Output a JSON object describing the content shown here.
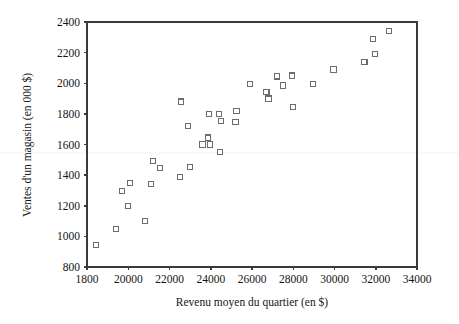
{
  "chart_data": {
    "type": "scatter",
    "title": "",
    "xlabel": "Revenu moyen du quartier (en $)",
    "ylabel": "Ventes d'un magasin (en 000 $)",
    "xlim": [
      18000,
      34000
    ],
    "ylim": [
      800,
      2400
    ],
    "xticks": [
      18000,
      20000,
      22000,
      24000,
      26000,
      28000,
      30000,
      32000,
      34000
    ],
    "xtick_labels": [
      "1800",
      "20000",
      "22000",
      "24000",
      "26000",
      "28000",
      "30000",
      "32000",
      "34000"
    ],
    "yticks": [
      800,
      1000,
      1200,
      1400,
      1600,
      1800,
      2000,
      2200,
      2400
    ],
    "ytick_labels": [
      "800",
      "1000",
      "1200",
      "1400",
      "1600",
      "1800",
      "2000",
      "2200",
      "2400"
    ],
    "grid": false,
    "legend": false,
    "marker": "open-square",
    "marker_color": "#6b6b70",
    "points": [
      [
        18450,
        945
      ],
      [
        19400,
        1050
      ],
      [
        19700,
        1295
      ],
      [
        20000,
        1200
      ],
      [
        20100,
        1350
      ],
      [
        20800,
        1100
      ],
      [
        21100,
        1340
      ],
      [
        21200,
        1490
      ],
      [
        21550,
        1445
      ],
      [
        22500,
        1390
      ],
      [
        22550,
        1880
      ],
      [
        22900,
        1720
      ],
      [
        23000,
        1455
      ],
      [
        23600,
        1600
      ],
      [
        23850,
        1645
      ],
      [
        23900,
        1800
      ],
      [
        23950,
        1600
      ],
      [
        24400,
        1800
      ],
      [
        24450,
        1550
      ],
      [
        24500,
        1755
      ],
      [
        25200,
        1745
      ],
      [
        25250,
        1820
      ],
      [
        25900,
        1995
      ],
      [
        26700,
        1945
      ],
      [
        26800,
        1900
      ],
      [
        27200,
        2045
      ],
      [
        27500,
        1985
      ],
      [
        27950,
        2050
      ],
      [
        28000,
        1845
      ],
      [
        28950,
        1995
      ],
      [
        29950,
        2090
      ],
      [
        31450,
        2140
      ],
      [
        31850,
        2290
      ],
      [
        31950,
        2190
      ],
      [
        32650,
        2340
      ]
    ]
  },
  "labels": {
    "figure_name": "scatter-plot-ventes-revenu"
  }
}
